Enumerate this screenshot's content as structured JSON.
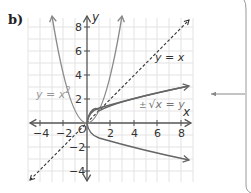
{
  "figure": {
    "part_label": "b)",
    "axes": {
      "x_label": "x",
      "y_label": "y",
      "origin_label": "O",
      "x_ticks": [
        "−4",
        "−2",
        "2",
        "4",
        "6",
        "8"
      ],
      "y_ticks": [
        "8",
        "6",
        "4",
        "2",
        "−2",
        "−4"
      ]
    },
    "curves": [
      {
        "name": "parabola",
        "label": "y = x",
        "superscript": "2",
        "style": "solid",
        "color": "#8a8a8a"
      },
      {
        "name": "mirror-line",
        "label": "y = x",
        "style": "dashed",
        "color": "#333333"
      },
      {
        "name": "inverse",
        "label": "√x = y",
        "prefix": "±",
        "style": "solid",
        "color": "#666666"
      }
    ],
    "colors": {
      "grid": "#e3e3e3",
      "axis": "#555555",
      "callout_line": "#888888"
    }
  }
}
